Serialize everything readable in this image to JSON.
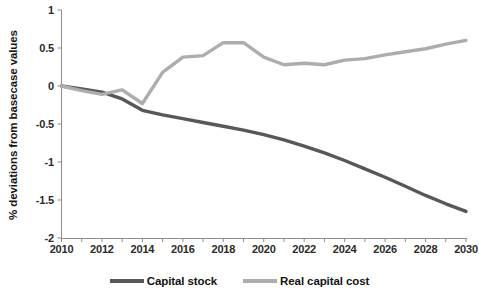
{
  "chart_data": {
    "type": "line",
    "title": "",
    "xlabel": "",
    "ylabel": "% deviations from basecase values",
    "xlim": [
      2010,
      2030
    ],
    "ylim": [
      -2,
      1
    ],
    "grid": false,
    "legend_position": "bottom",
    "x": [
      2010,
      2011,
      2012,
      2013,
      2014,
      2015,
      2016,
      2017,
      2018,
      2019,
      2020,
      2021,
      2022,
      2023,
      2024,
      2025,
      2026,
      2027,
      2028,
      2029,
      2030
    ],
    "xticks": [
      "2010",
      "2012",
      "2014",
      "2016",
      "2018",
      "2020",
      "2022",
      "2024",
      "2026",
      "2028",
      "2030"
    ],
    "yticks": [
      "1",
      "0.5",
      "0",
      "-0.5",
      "-1",
      "-1.5",
      "-2"
    ],
    "series": [
      {
        "name": "Capital stock",
        "color": "#585858",
        "values": [
          0.0,
          -0.04,
          -0.08,
          -0.17,
          -0.32,
          -0.38,
          -0.43,
          -0.48,
          -0.53,
          -0.58,
          -0.64,
          -0.71,
          -0.79,
          -0.88,
          -0.98,
          -1.09,
          -1.2,
          -1.32,
          -1.44,
          -1.55,
          -1.65
        ]
      },
      {
        "name": "Real capital cost",
        "color": "#adadad",
        "values": [
          0.0,
          -0.06,
          -0.11,
          -0.05,
          -0.23,
          0.18,
          0.38,
          0.4,
          0.57,
          0.57,
          0.38,
          0.28,
          0.3,
          0.28,
          0.34,
          0.36,
          0.41,
          0.45,
          0.49,
          0.55,
          0.6
        ]
      }
    ]
  },
  "legend": {
    "items": [
      {
        "label": "Capital stock",
        "color": "#585858"
      },
      {
        "label": "Real capital cost",
        "color": "#adadad"
      }
    ]
  },
  "axes": {
    "y_title": "% deviations from basecase values",
    "y_tick_labels": [
      "1",
      "0.5",
      "0",
      "-0.5",
      "-1",
      "-1.5",
      "-2"
    ],
    "x_tick_labels": [
      "2010",
      "2012",
      "2014",
      "2016",
      "2018",
      "2020",
      "2022",
      "2024",
      "2026",
      "2028",
      "2030"
    ],
    "axis_color": "#8c8c8c"
  }
}
